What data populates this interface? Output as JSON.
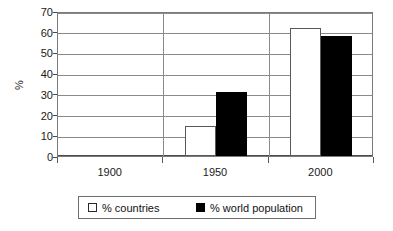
{
  "chart_data": {
    "type": "bar",
    "title": "",
    "xlabel": "",
    "ylabel": "%",
    "categories": [
      "1900",
      "1950",
      "2000"
    ],
    "series": [
      {
        "name": "% countries",
        "values": [
          0,
          14.5,
          62
        ],
        "color": "#ffffff"
      },
      {
        "name": "% world population",
        "values": [
          0,
          31,
          58
        ],
        "color": "#000000"
      }
    ],
    "ylim": [
      0,
      70
    ],
    "yticks": [
      0,
      10,
      20,
      30,
      40,
      50,
      60,
      70
    ],
    "ytick_labels": [
      "0",
      "10",
      "20",
      "30",
      "40",
      "50",
      "60",
      "70"
    ],
    "grid": true,
    "legend_position": "bottom"
  },
  "axis": {
    "y_title": "%",
    "tick_labels": [
      "70",
      "60",
      "50",
      "40",
      "30",
      "20",
      "10",
      "0"
    ],
    "x_labels": [
      "1900",
      "1950",
      "2000"
    ]
  },
  "legend": {
    "entries": [
      {
        "label": "% countries",
        "swatch": "white-square-icon"
      },
      {
        "label": "% world population",
        "swatch": "black-square-icon"
      }
    ]
  }
}
